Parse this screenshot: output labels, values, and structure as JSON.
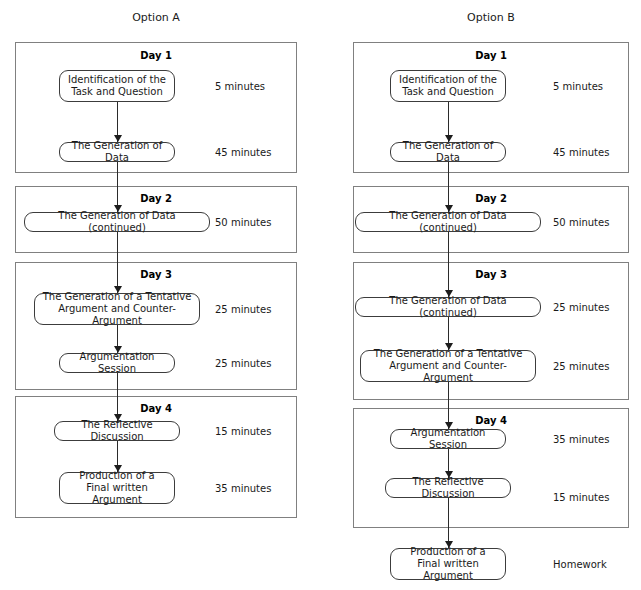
{
  "figure": {
    "clipped_top_text": "",
    "columns": [
      {
        "title": "Option A",
        "title_x": 156,
        "title_y": 11
      },
      {
        "title": "Option B",
        "title_x": 491,
        "title_y": 11
      }
    ]
  },
  "option_a": {
    "title": "Option A",
    "box_left": 15,
    "box_width": 282,
    "node_center": 117,
    "node_left": 58,
    "duration_x": 215,
    "days": [
      {
        "label": "Day 1",
        "label_y": 50,
        "top": 42,
        "height": 131,
        "nodes": [
          {
            "text": "Identification of the\nTask and Question",
            "top": 70,
            "height": 32,
            "width": 116,
            "duration": "5 minutes",
            "duration_y": 81
          },
          {
            "text": "The Generation of Data",
            "top": 142,
            "height": 20,
            "width": 116,
            "duration": "45 minutes",
            "duration_y": 147
          }
        ]
      },
      {
        "label": "Day 2",
        "label_y": 193,
        "top": 186,
        "height": 67,
        "nodes": [
          {
            "text": "The Generation of Data (continued)",
            "top": 212,
            "height": 20,
            "width": 186,
            "duration": "50 minutes",
            "duration_y": 217
          }
        ]
      },
      {
        "label": "Day 3",
        "label_y": 269,
        "top": 262,
        "height": 128,
        "nodes": [
          {
            "text": "The Generation of a Tentative\nArgument and Counter-Argument",
            "top": 293,
            "height": 32,
            "width": 166,
            "duration": "25 minutes",
            "duration_y": 304
          },
          {
            "text": "Argumentation Session",
            "top": 353,
            "height": 20,
            "width": 116,
            "duration": "25 minutes",
            "duration_y": 358
          }
        ]
      },
      {
        "label": "Day 4",
        "label_y": 403,
        "top": 396,
        "height": 122,
        "nodes": [
          {
            "text": "The Reflective Discussion",
            "top": 421,
            "height": 20,
            "width": 126,
            "duration": "15 minutes",
            "duration_y": 426
          },
          {
            "text": "Production of a\nFinal written Argument",
            "top": 472,
            "height": 32,
            "width": 116,
            "duration": "35 minutes",
            "duration_y": 483
          }
        ]
      }
    ]
  },
  "option_b": {
    "title": "Option B",
    "box_left": 353,
    "box_width": 276,
    "node_center": 448,
    "duration_x": 553,
    "days": [
      {
        "label": "Day 1",
        "label_y": 50,
        "top": 42,
        "height": 131,
        "nodes": [
          {
            "text": "Identification of the\nTask and Question",
            "top": 70,
            "height": 32,
            "width": 116,
            "duration": "5 minutes",
            "duration_y": 81
          },
          {
            "text": "The Generation of Data",
            "top": 142,
            "height": 20,
            "width": 116,
            "duration": "45 minutes",
            "duration_y": 147
          }
        ]
      },
      {
        "label": "Day 2",
        "label_y": 193,
        "top": 186,
        "height": 67,
        "nodes": [
          {
            "text": "The Generation of Data (continued)",
            "top": 212,
            "height": 20,
            "width": 186,
            "duration": "50 minutes",
            "duration_y": 217
          }
        ]
      },
      {
        "label": "Day 3",
        "label_y": 269,
        "top": 262,
        "height": 138,
        "nodes": [
          {
            "text": "The Generation of Data (continued)",
            "top": 297,
            "height": 20,
            "width": 186,
            "duration": "25 minutes",
            "duration_y": 302
          },
          {
            "text": "The Generation of a Tentative\nArgument and Counter-Argument",
            "top": 350,
            "height": 32,
            "width": 176,
            "duration": "25 minutes",
            "duration_y": 361
          }
        ]
      },
      {
        "label": "Day 4",
        "label_y": 415,
        "top": 408,
        "height": 120,
        "nodes": [
          {
            "text": "Argumentation Session",
            "top": 429,
            "height": 20,
            "width": 116,
            "duration": "35 minutes",
            "duration_y": 434
          },
          {
            "text": "The Reflective Discussion",
            "top": 478,
            "height": 20,
            "width": 126,
            "duration": "15 minutes",
            "duration_y": 492
          }
        ]
      }
    ],
    "trailing_node": {
      "text": "Production of a\nFinal written Argument",
      "top": 548,
      "height": 32,
      "width": 116,
      "duration": "Homework",
      "duration_y": 559
    }
  }
}
